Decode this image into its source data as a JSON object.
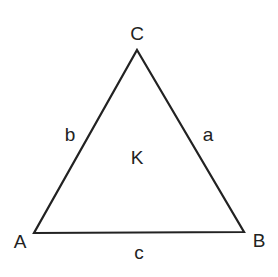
{
  "diagram": {
    "type": "triangle",
    "vertices": [
      {
        "label": "A",
        "x": 34,
        "y": 233,
        "label_x": 20,
        "label_y": 248
      },
      {
        "label": "B",
        "x": 244,
        "y": 232,
        "label_x": 259,
        "label_y": 247
      },
      {
        "label": "C",
        "x": 137,
        "y": 50,
        "label_x": 137,
        "label_y": 40
      }
    ],
    "sides": [
      {
        "label": "a",
        "between": "B-C",
        "label_x": 208,
        "label_y": 141
      },
      {
        "label": "b",
        "between": "A-C",
        "label_x": 70,
        "label_y": 141
      },
      {
        "label": "c",
        "between": "A-B",
        "label_x": 139,
        "label_y": 259
      }
    ],
    "area_label": {
      "label": "K",
      "x": 137,
      "y": 164
    },
    "stroke_color": "#222222",
    "background": "#ffffff"
  }
}
